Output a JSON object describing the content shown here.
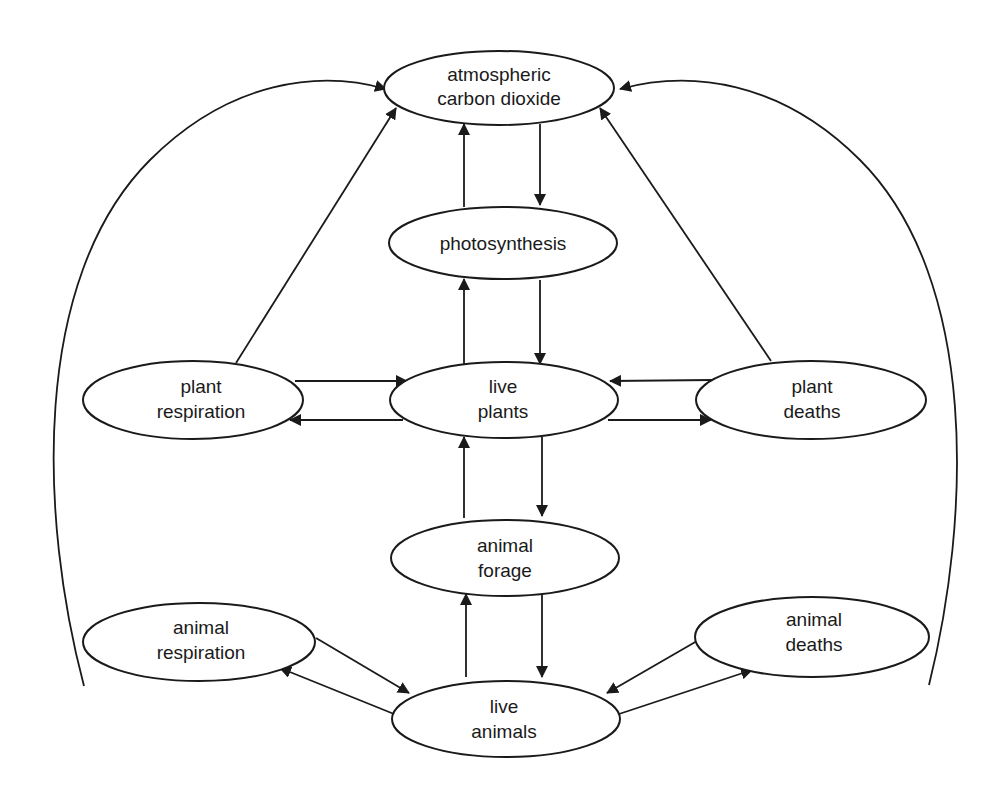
{
  "diagram": {
    "type": "flow",
    "title": "",
    "colors": {
      "stroke": "#1a1a1a",
      "fill": "#ffffff",
      "text": "#1a1a1a",
      "background": "#ffffff"
    },
    "nodes": {
      "co2": {
        "id": "co2",
        "line1": "atmospheric",
        "line2": "carbon dioxide"
      },
      "photo": {
        "id": "photo",
        "line1": "photosynthesis",
        "line2": ""
      },
      "plantresp": {
        "id": "plantresp",
        "line1": "plant",
        "line2": "respiration"
      },
      "liveplants": {
        "id": "liveplants",
        "line1": "live",
        "line2": "plants"
      },
      "plantdeath": {
        "id": "plantdeath",
        "line1": "plant",
        "line2": "deaths"
      },
      "forage": {
        "id": "forage",
        "line1": "animal",
        "line2": "forage"
      },
      "animresp": {
        "id": "animresp",
        "line1": "animal",
        "line2": "respiration"
      },
      "liveanim": {
        "id": "liveanim",
        "line1": "live",
        "line2": "animals"
      },
      "animdeath": {
        "id": "animdeath",
        "line1": "animal",
        "line2": "deaths"
      }
    },
    "edges": [
      {
        "from": "photo",
        "to": "co2"
      },
      {
        "from": "co2",
        "to": "photo"
      },
      {
        "from": "liveplants",
        "to": "photo"
      },
      {
        "from": "photo",
        "to": "liveplants"
      },
      {
        "from": "plantresp",
        "to": "co2"
      },
      {
        "from": "plantdeath",
        "to": "co2"
      },
      {
        "from": "plantresp",
        "to": "liveplants"
      },
      {
        "from": "liveplants",
        "to": "plantresp"
      },
      {
        "from": "plantdeath",
        "to": "liveplants"
      },
      {
        "from": "liveplants",
        "to": "plantdeath"
      },
      {
        "from": "forage",
        "to": "liveplants"
      },
      {
        "from": "liveplants",
        "to": "forage"
      },
      {
        "from": "liveanim",
        "to": "forage"
      },
      {
        "from": "forage",
        "to": "liveanim"
      },
      {
        "from": "animresp",
        "to": "liveanim"
      },
      {
        "from": "liveanim",
        "to": "animresp"
      },
      {
        "from": "animdeath",
        "to": "liveanim"
      },
      {
        "from": "liveanim",
        "to": "animdeath"
      },
      {
        "from": "animresp",
        "to": "co2"
      },
      {
        "from": "animdeath",
        "to": "co2"
      }
    ]
  }
}
